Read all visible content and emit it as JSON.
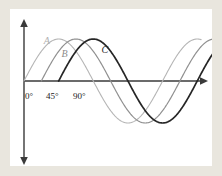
{
  "figure": {
    "background_color": "#e9e6de",
    "plot_background_color": "#ffffff",
    "axis_color": "#3a3a3a"
  },
  "axes": {
    "x_axis_name": "horizontal-axis",
    "y_axis_name": "vertical-axis",
    "x_arrow": "right",
    "y_arrows": "both",
    "tick_labels": [
      {
        "text": "0°",
        "x_px": 15,
        "y_px": 83
      },
      {
        "text": "45°",
        "x_px": 36,
        "y_px": 83
      },
      {
        "text": "90°",
        "x_px": 63,
        "y_px": 83
      }
    ]
  },
  "chart_data": {
    "type": "line",
    "title": "",
    "subtitle": "",
    "xlabel": "",
    "ylabel": "",
    "xlim": [
      -20,
      560
    ],
    "ylim": [
      -1.15,
      1.15
    ],
    "grid": false,
    "legend_position": "inline-curve-labels",
    "x_tick_values": [
      0,
      45,
      90
    ],
    "x_tick_labels": [
      "0°",
      "45°",
      "90°"
    ],
    "y_tick_values": [],
    "y_tick_labels": [],
    "annotations": [
      {
        "text": "A",
        "x": 62,
        "y": 0.93,
        "color": "#b0b0b0"
      },
      {
        "text": "B",
        "x": 108,
        "y": 0.62,
        "color": "#8c8c8c"
      },
      {
        "text": "C",
        "x": 212,
        "y": 0.72,
        "color": "#2a2a2a"
      }
    ],
    "series": [
      {
        "name": "A",
        "label": "A",
        "color": "#b5b5b5",
        "line_width": 1.1,
        "equation": "y = sin(x)",
        "phase_shift_deg": 0,
        "amplitude": 1,
        "period_deg": 360,
        "x_start_deg": 0,
        "x_end_deg": 460,
        "peak": {
          "x": 90,
          "y": 1
        },
        "trough": {
          "x": 270,
          "y": -1
        },
        "zero_crossings_deg": [
          0,
          180,
          360
        ]
      },
      {
        "name": "B",
        "label": "B",
        "color": "#909090",
        "line_width": 1.2,
        "equation": "y = sin(x − 45°)",
        "phase_shift_deg": 45,
        "amplitude": 1,
        "period_deg": 360,
        "x_start_deg": 45,
        "x_end_deg": 505,
        "peak": {
          "x": 135,
          "y": 1
        },
        "trough": {
          "x": 315,
          "y": -1
        },
        "zero_crossings_deg": [
          45,
          225,
          405
        ]
      },
      {
        "name": "C",
        "label": "C",
        "color": "#262626",
        "line_width": 1.7,
        "equation": "y = sin(x − 90°)",
        "phase_shift_deg": 90,
        "amplitude": 1,
        "period_deg": 360,
        "x_start_deg": 90,
        "x_end_deg": 550,
        "peak": {
          "x": 180,
          "y": 1
        },
        "trough": {
          "x": 360,
          "y": -1
        },
        "zero_crossings_deg": [
          90,
          270,
          450
        ]
      }
    ]
  }
}
